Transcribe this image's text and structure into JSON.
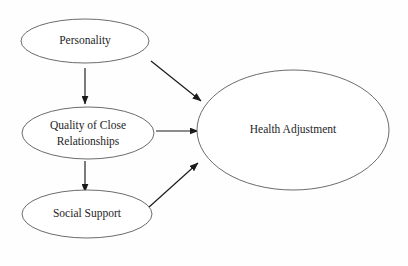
{
  "diagram": {
    "background_color": "#fefefe",
    "node_stroke_color": "#5a5a5a",
    "edge_color": "#1a1a1a",
    "text_color": "#1e1e26",
    "nodes": [
      {
        "id": "personality",
        "label": "Personality",
        "label_line1": "Personality",
        "label_line2": "",
        "cx": 85,
        "cy": 41,
        "rx": 64,
        "ry": 22,
        "font_size": 11.5
      },
      {
        "id": "quality-of-close-relationships",
        "label": "Quality of Close Relationships",
        "label_line1": "Quality of Close",
        "label_line2": "Relationships",
        "cx": 88,
        "cy": 133,
        "rx": 66,
        "ry": 26,
        "font_size": 11.5
      },
      {
        "id": "social-support",
        "label": "Social Support",
        "label_line1": "Social Support",
        "label_line2": "",
        "cx": 87,
        "cy": 214,
        "rx": 65,
        "ry": 24,
        "font_size": 11.5
      },
      {
        "id": "health-adjustment",
        "label": "Health Adjustment",
        "label_line1": "Health Adjustment",
        "label_line2": "",
        "cx": 293,
        "cy": 130,
        "rx": 96,
        "ry": 60,
        "font_size": 11.5
      }
    ],
    "edges": [
      {
        "id": "personality-to-quality",
        "from": "personality",
        "to": "quality-of-close-relationships",
        "kind": "vertical-arrow",
        "x1": 85,
        "y1": 68,
        "x2": 85,
        "y2": 104
      },
      {
        "id": "personality-to-health",
        "from": "personality",
        "to": "health-adjustment",
        "kind": "diagonal-arrow",
        "x1": 151,
        "y1": 61,
        "x2": 201,
        "y2": 101
      },
      {
        "id": "quality-to-health",
        "from": "quality-of-close-relationships",
        "to": "health-adjustment",
        "kind": "horizontal-arrow",
        "x1": 156,
        "y1": 131,
        "x2": 198,
        "y2": 131
      },
      {
        "id": "quality-to-social-support",
        "from": "quality-of-close-relationships",
        "to": "social-support",
        "kind": "vertical-arrow",
        "x1": 85,
        "y1": 161,
        "x2": 85,
        "y2": 192
      },
      {
        "id": "social-support-to-health",
        "from": "social-support",
        "to": "health-adjustment",
        "kind": "diagonal-arrow",
        "x1": 148,
        "y1": 208,
        "x2": 198,
        "y2": 163
      }
    ]
  }
}
